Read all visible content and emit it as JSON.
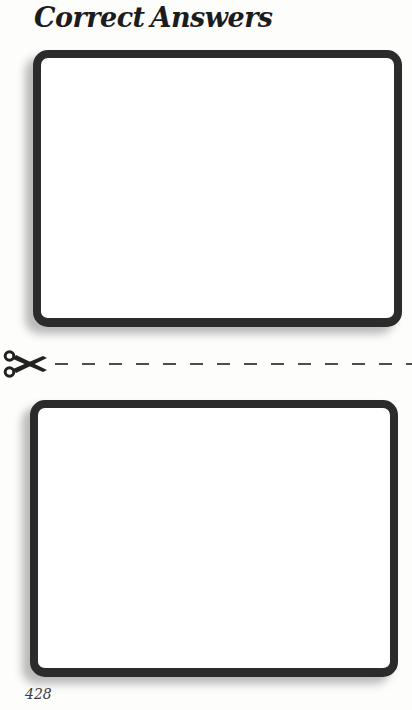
{
  "page": {
    "title": "Correct Answers",
    "page_number": "428"
  },
  "cut_line": {
    "icon": "scissors-icon",
    "style": "dashed"
  },
  "boxes": [
    {
      "name": "answer-box-top",
      "content": ""
    },
    {
      "name": "answer-box-bottom",
      "content": ""
    }
  ],
  "colors": {
    "background": "#fdfdfc",
    "box_border": "#2b2b2b",
    "title_text": "#1c1c1c",
    "dash_line": "#4d4d4d",
    "page_number_text": "#3a3a3a"
  }
}
